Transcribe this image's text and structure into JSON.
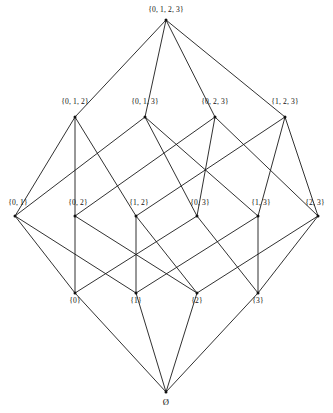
{
  "diagram": {
    "kind": "hasse-diagram",
    "background_color": "#ffffff",
    "line_color": "#1a1a1a",
    "text_color": "#111111",
    "width": 333,
    "height": 413,
    "levels": [
      {
        "rank": 4,
        "y": 20,
        "label_y": 6,
        "nodes": [
          "n1111"
        ]
      },
      {
        "rank": 3,
        "y": 117,
        "label_y": 97,
        "nodes": [
          "n0111",
          "n1011",
          "n1101",
          "n1110"
        ]
      },
      {
        "rank": 2,
        "y": 216,
        "label_y": 199,
        "nodes": [
          "n0011",
          "n0101",
          "n0110",
          "n1001",
          "n1010",
          "n1100"
        ]
      },
      {
        "rank": 1,
        "y": 293,
        "label_y": 297,
        "nodes": [
          "n0001",
          "n0010",
          "n0100",
          "n1000"
        ]
      },
      {
        "rank": 0,
        "y": 392,
        "label_y": 398,
        "nodes": [
          "nempty"
        ]
      }
    ],
    "nodes": [
      {
        "id": "n1111",
        "label": "{0, 1, 2, 3}",
        "x": 166,
        "y": 20,
        "label_x": 166,
        "label_y": 6,
        "rank": 4
      },
      {
        "id": "n0111",
        "label": "{0, 1, 2}",
        "x": 75,
        "y": 117,
        "label_x": 75,
        "label_y": 98,
        "rank": 3
      },
      {
        "id": "n1011",
        "label": "{0, 1, 3}",
        "x": 145,
        "y": 117,
        "label_x": 145,
        "label_y": 98,
        "rank": 3
      },
      {
        "id": "n1101",
        "label": "{0, 2, 3}",
        "x": 215,
        "y": 117,
        "label_x": 215,
        "label_y": 98,
        "rank": 3
      },
      {
        "id": "n1110",
        "label": "{1, 2, 3}",
        "x": 285,
        "y": 117,
        "label_x": 285,
        "label_y": 98,
        "rank": 3
      },
      {
        "id": "n0011",
        "label": "{0, 1}",
        "x": 15,
        "y": 216,
        "label_x": 18,
        "label_y": 199,
        "rank": 2
      },
      {
        "id": "n0101",
        "label": "{0, 2}",
        "x": 75,
        "y": 216,
        "label_x": 78,
        "label_y": 199,
        "rank": 2
      },
      {
        "id": "n0110",
        "label": "{1, 2}",
        "x": 136,
        "y": 216,
        "label_x": 139,
        "label_y": 199,
        "rank": 2
      },
      {
        "id": "n1001",
        "label": "{0, 3}",
        "x": 197,
        "y": 216,
        "label_x": 200,
        "label_y": 199,
        "rank": 2
      },
      {
        "id": "n1010",
        "label": "{1, 3}",
        "x": 258,
        "y": 216,
        "label_x": 261,
        "label_y": 199,
        "rank": 2
      },
      {
        "id": "n1100",
        "label": "{2, 3}",
        "x": 318,
        "y": 216,
        "label_x": 315,
        "label_y": 199,
        "rank": 2
      },
      {
        "id": "n0001",
        "label": "{0}",
        "x": 75,
        "y": 293,
        "label_x": 75,
        "label_y": 297,
        "rank": 1
      },
      {
        "id": "n0010",
        "label": "{1}",
        "x": 136,
        "y": 293,
        "label_x": 136,
        "label_y": 297,
        "rank": 1
      },
      {
        "id": "n0100",
        "label": "{2}",
        "x": 197,
        "y": 293,
        "label_x": 197,
        "label_y": 297,
        "rank": 1
      },
      {
        "id": "n1000",
        "label": "{3}",
        "x": 258,
        "y": 293,
        "label_x": 258,
        "label_y": 297,
        "rank": 1
      },
      {
        "id": "nempty",
        "label": "Ø",
        "x": 166,
        "y": 392,
        "label_x": 166,
        "label_y": 398,
        "rank": 0
      }
    ],
    "edges": [
      {
        "from": "n1111",
        "to": "n0111"
      },
      {
        "from": "n1111",
        "to": "n1011"
      },
      {
        "from": "n1111",
        "to": "n1101"
      },
      {
        "from": "n1111",
        "to": "n1110"
      },
      {
        "from": "n0111",
        "to": "n0011"
      },
      {
        "from": "n0111",
        "to": "n0101"
      },
      {
        "from": "n0111",
        "to": "n0110"
      },
      {
        "from": "n1011",
        "to": "n0011"
      },
      {
        "from": "n1011",
        "to": "n1001"
      },
      {
        "from": "n1011",
        "to": "n1010"
      },
      {
        "from": "n1101",
        "to": "n0101"
      },
      {
        "from": "n1101",
        "to": "n1001"
      },
      {
        "from": "n1101",
        "to": "n1100"
      },
      {
        "from": "n1110",
        "to": "n0110"
      },
      {
        "from": "n1110",
        "to": "n1010"
      },
      {
        "from": "n1110",
        "to": "n1100"
      },
      {
        "from": "n0011",
        "to": "n0001"
      },
      {
        "from": "n0011",
        "to": "n0010"
      },
      {
        "from": "n0101",
        "to": "n0001"
      },
      {
        "from": "n0101",
        "to": "n0100"
      },
      {
        "from": "n0110",
        "to": "n0010"
      },
      {
        "from": "n0110",
        "to": "n0100"
      },
      {
        "from": "n1001",
        "to": "n0001"
      },
      {
        "from": "n1001",
        "to": "n1000"
      },
      {
        "from": "n1010",
        "to": "n0010"
      },
      {
        "from": "n1010",
        "to": "n1000"
      },
      {
        "from": "n1100",
        "to": "n0100"
      },
      {
        "from": "n1100",
        "to": "n1000"
      },
      {
        "from": "n0001",
        "to": "nempty"
      },
      {
        "from": "n0010",
        "to": "nempty"
      },
      {
        "from": "n0100",
        "to": "nempty"
      },
      {
        "from": "n1000",
        "to": "nempty"
      }
    ]
  }
}
